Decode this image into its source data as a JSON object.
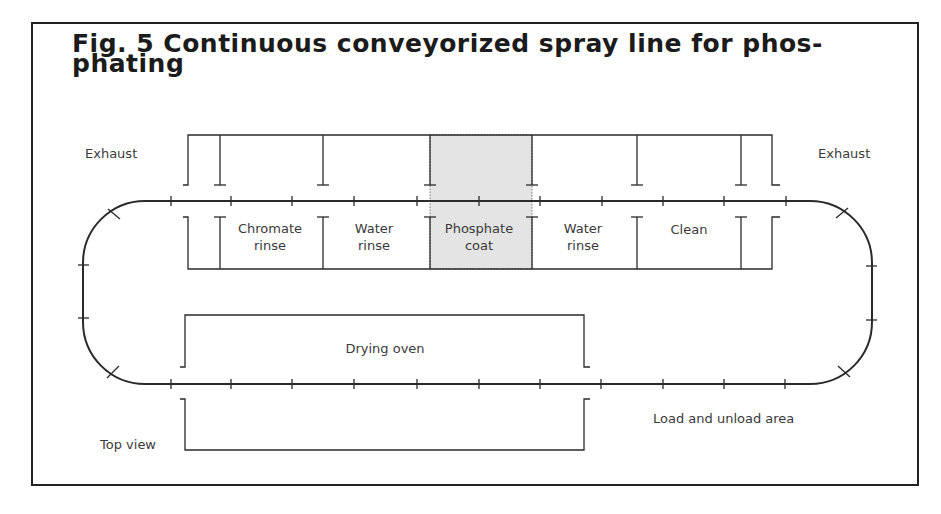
{
  "figure": {
    "title_line1": "Fig. 5 Continuous conveyorized spray line for phos-",
    "title_line2": "phating"
  },
  "labels": {
    "exhaust_left": "Exhaust",
    "exhaust_right": "Exhaust",
    "top_view": "Top view",
    "load_unload": "Load and unload area",
    "drying_oven": "Drying oven"
  },
  "stages": [
    {
      "line1": "Chromate",
      "line2": "rinse"
    },
    {
      "line1": "Water",
      "line2": "rinse"
    },
    {
      "line1": "Phosphate",
      "line2": "coat",
      "highlighted": true
    },
    {
      "line1": "Water",
      "line2": "rinse"
    },
    {
      "line1": "Clean",
      "line2": ""
    }
  ],
  "colors": {
    "line": "#2a2a2a",
    "highlight_fill": "#e4e4e4"
  }
}
